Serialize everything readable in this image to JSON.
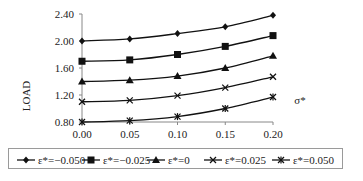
{
  "chart_data": {
    "type": "line",
    "title": "",
    "xlabel": "σ*",
    "ylabel": "LOAD",
    "x": [
      0.0,
      0.05,
      0.1,
      0.15,
      0.2
    ],
    "x_tick_labels": [
      "0.00",
      "0.05",
      "0.10",
      "0.15",
      "0.20"
    ],
    "y_tick_labels": [
      "0.80",
      "1.20",
      "1.60",
      "2.00",
      "2.40"
    ],
    "ylim": [
      0.8,
      2.4
    ],
    "xlim": [
      0.0,
      0.2
    ],
    "grid": false,
    "legend_position": "bottom",
    "series": [
      {
        "name": "ε*=−0.050",
        "marker": "diamond",
        "values": [
          2.0,
          2.03,
          2.11,
          2.21,
          2.38
        ]
      },
      {
        "name": "ε*=−0.025",
        "marker": "square",
        "values": [
          1.7,
          1.72,
          1.8,
          1.92,
          2.08
        ]
      },
      {
        "name": "ε*=0",
        "marker": "triangle",
        "values": [
          1.4,
          1.42,
          1.48,
          1.6,
          1.78
        ]
      },
      {
        "name": "ε*=0.025",
        "marker": "x",
        "values": [
          1.1,
          1.12,
          1.19,
          1.31,
          1.47
        ]
      },
      {
        "name": "ε*=0.050",
        "marker": "star",
        "values": [
          0.8,
          0.82,
          0.88,
          1.0,
          1.17
        ]
      }
    ]
  },
  "axes": {
    "xlabel": "σ*",
    "ylabel": "LOAD"
  },
  "legend": {
    "items": [
      "ε*=−0.050",
      "ε*=−0.025",
      "ε*=0",
      "ε*=0.025",
      "ε*=0.050"
    ]
  }
}
